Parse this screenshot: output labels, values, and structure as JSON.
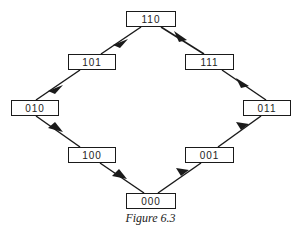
{
  "figure": {
    "caption": "Figure 6.3",
    "nodes": [
      {
        "id": "110",
        "label": "110",
        "x": 126,
        "y": 11,
        "w": 50,
        "h": 16
      },
      {
        "id": "101",
        "label": "101",
        "x": 68,
        "y": 54,
        "w": 48,
        "h": 16
      },
      {
        "id": "010",
        "label": "010",
        "x": 11,
        "y": 100,
        "w": 48,
        "h": 16
      },
      {
        "id": "100",
        "label": "100",
        "x": 68,
        "y": 147,
        "w": 48,
        "h": 16
      },
      {
        "id": "000",
        "label": "000",
        "x": 126,
        "y": 193,
        "w": 50,
        "h": 16
      },
      {
        "id": "001",
        "label": "001",
        "x": 185,
        "y": 147,
        "w": 49,
        "h": 16
      },
      {
        "id": "011",
        "label": "011",
        "x": 243,
        "y": 100,
        "w": 48,
        "h": 16
      },
      {
        "id": "111",
        "label": "111",
        "x": 185,
        "y": 54,
        "w": 49,
        "h": 16
      }
    ],
    "edges": [
      {
        "from": "110",
        "to": "101"
      },
      {
        "from": "101",
        "to": "010"
      },
      {
        "from": "010",
        "to": "100"
      },
      {
        "from": "100",
        "to": "000"
      },
      {
        "from": "000",
        "to": "001"
      },
      {
        "from": "001",
        "to": "011"
      },
      {
        "from": "011",
        "to": "111"
      },
      {
        "from": "111",
        "to": "110"
      }
    ],
    "colors": {
      "stroke": "#1a1a1a",
      "background": "#ffffff"
    }
  }
}
